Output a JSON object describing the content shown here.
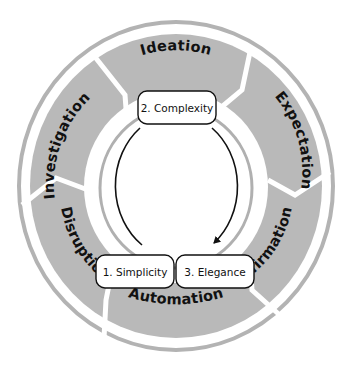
{
  "diagram": {
    "type": "cycle",
    "colors": {
      "segment_fill": "#b9b9b9",
      "outer_ring": "#b3b3b3",
      "inner_ring": "#b0b0b0",
      "gap": "#ffffff",
      "arrow": "#111111",
      "box_fill": "#ffffff",
      "box_stroke": "#111111",
      "text": "#111111"
    },
    "outer_segments": [
      {
        "label": "Ideation"
      },
      {
        "label": "Expectation"
      },
      {
        "label": "Affirmation"
      },
      {
        "label": "Automation"
      },
      {
        "label": "Disruption"
      },
      {
        "label": "Investigation"
      }
    ],
    "inner_cycle": [
      {
        "label": "1. Simplicity"
      },
      {
        "label": "2. Complexity"
      },
      {
        "label": "3. Elegance"
      }
    ]
  }
}
